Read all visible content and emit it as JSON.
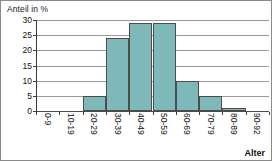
{
  "chart_data": {
    "type": "bar",
    "title": "",
    "ylabel": "Anteil in %",
    "xlabel": "Alter",
    "categories": [
      "0-9",
      "10-19",
      "20-29",
      "30-39",
      "40-49",
      "50-59",
      "60-69",
      "70-79",
      "80-89",
      "90-92"
    ],
    "values": [
      0,
      0,
      5,
      24,
      29,
      29,
      10,
      5,
      1,
      0
    ],
    "ylim": [
      0,
      30
    ],
    "yticks": [
      0,
      5,
      10,
      15,
      20,
      25,
      30
    ],
    "ytick_labels": [
      "0",
      "5",
      "10",
      "15",
      "20",
      "25",
      "30"
    ],
    "grid": true,
    "legend": false,
    "bar_color": "#7fb8b8",
    "bar_edge_color": "#4d4d4d",
    "grid_color": "#9a9a9a",
    "axis_color": "#3c3c3c"
  }
}
